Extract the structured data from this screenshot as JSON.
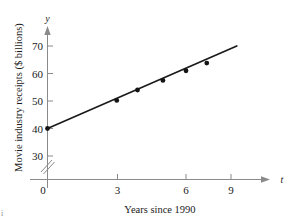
{
  "chart_data": {
    "type": "scatter",
    "title": "",
    "subtitle": "",
    "xlabel": "Years since 1990",
    "ylabel": "Movie industry receipts ($ billions)",
    "x_axis_variable": "t",
    "y_axis_variable": "y",
    "xlim": [
      0,
      9.8
    ],
    "ylim": [
      30,
      72
    ],
    "y_axis_break": true,
    "grid": false,
    "legend": "none",
    "x_ticks": [
      0,
      3,
      6,
      9
    ],
    "x_tick_labels": [
      "0",
      "3",
      "6",
      "9"
    ],
    "y_ticks": [
      30,
      40,
      50,
      60,
      70
    ],
    "y_tick_labels": [
      "30",
      "40",
      "50",
      "60",
      "70"
    ],
    "series": [
      {
        "name": "Movie industry receipts",
        "marker": "filled-circle",
        "color": "#141414",
        "points": [
          {
            "x": 0,
            "y": 40
          },
          {
            "x": 3,
            "y": 50.2
          },
          {
            "x": 3.9,
            "y": 54
          },
          {
            "x": 5,
            "y": 57.5
          },
          {
            "x": 6,
            "y": 61
          },
          {
            "x": 6.9,
            "y": 63.8
          }
        ]
      }
    ],
    "trendline": {
      "name": "line of best fit",
      "color": "#1a1a1a",
      "x_start": 0,
      "y_start": 40,
      "x_end": 8.2,
      "y_end": 70
    }
  },
  "figure": {
    "corner_mark": "i"
  }
}
